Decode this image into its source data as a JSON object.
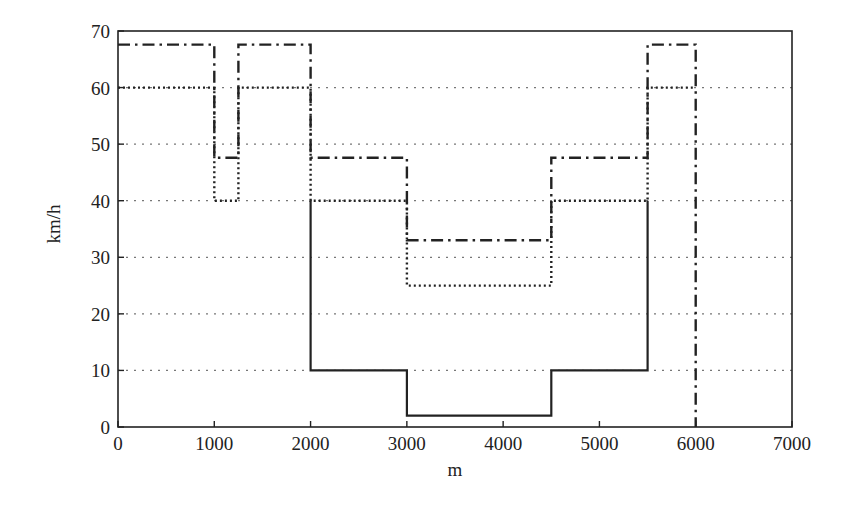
{
  "chart_data": {
    "type": "line",
    "title": "",
    "xlabel": "m",
    "ylabel": "km/h",
    "xlim": [
      0,
      7000
    ],
    "ylim": [
      0,
      70
    ],
    "xticks": [
      0,
      1000,
      2000,
      3000,
      4000,
      5000,
      6000,
      7000
    ],
    "yticks": [
      0,
      10,
      20,
      30,
      40,
      50,
      60,
      70
    ],
    "grid": {
      "horizontal": true,
      "vertical": false,
      "style": "dotted"
    },
    "legend": null,
    "step": true,
    "series": [
      {
        "name": "solid",
        "style": "solid",
        "color": "#222222",
        "points": [
          [
            2000,
            40
          ],
          [
            2000,
            10
          ],
          [
            3000,
            10
          ],
          [
            3000,
            2
          ],
          [
            4500,
            2
          ],
          [
            4500,
            10
          ],
          [
            5500,
            10
          ],
          [
            5500,
            40
          ]
        ]
      },
      {
        "name": "dotted",
        "style": "dotted",
        "color": "#222222",
        "points": [
          [
            0,
            60
          ],
          [
            1000,
            60
          ],
          [
            1000,
            40
          ],
          [
            1250,
            40
          ],
          [
            1250,
            60
          ],
          [
            2000,
            60
          ],
          [
            2000,
            40
          ],
          [
            3000,
            40
          ],
          [
            3000,
            25
          ],
          [
            4500,
            25
          ],
          [
            4500,
            40
          ],
          [
            5500,
            40
          ],
          [
            5500,
            60
          ],
          [
            6000,
            60
          ]
        ]
      },
      {
        "name": "dash-dot",
        "style": "dashdot",
        "color": "#222222",
        "points": [
          [
            0,
            67.6
          ],
          [
            1000,
            67.6
          ],
          [
            1000,
            47.6
          ],
          [
            1250,
            47.6
          ],
          [
            1250,
            67.6
          ],
          [
            2000,
            67.6
          ],
          [
            2000,
            47.6
          ],
          [
            3000,
            47.6
          ],
          [
            3000,
            33
          ],
          [
            4500,
            33
          ],
          [
            4500,
            47.6
          ],
          [
            5500,
            47.6
          ],
          [
            5500,
            67.6
          ],
          [
            6000,
            67.6
          ],
          [
            6000,
            0
          ]
        ]
      }
    ]
  }
}
